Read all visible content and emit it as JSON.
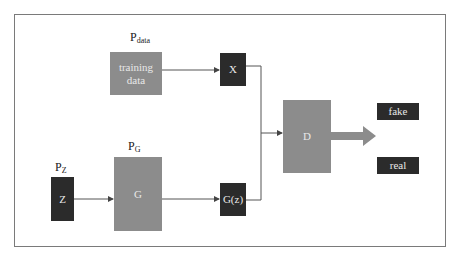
{
  "diagram": {
    "type": "GAN architecture",
    "labels": {
      "p_data": {
        "base": "P",
        "sub": "data"
      },
      "p_g": {
        "base": "P",
        "sub": "G"
      },
      "p_z": {
        "base": "P",
        "sub": "Z"
      }
    },
    "nodes": {
      "training_data": {
        "line1": "training",
        "line2": "data"
      },
      "x": "X",
      "z": "Z",
      "g": "G",
      "gz": "G(z)",
      "d": "D",
      "fake": "fake",
      "real": "real"
    },
    "edges": [
      {
        "from": "training_data",
        "to": "x"
      },
      {
        "from": "z",
        "to": "g"
      },
      {
        "from": "g",
        "to": "gz"
      },
      {
        "from": "x",
        "to": "d"
      },
      {
        "from": "gz",
        "to": "d"
      },
      {
        "from": "d",
        "to": "output",
        "style": "thick"
      }
    ],
    "colors": {
      "gray_box": "#8c8c8c",
      "dark_box": "#2b2b2b",
      "line": "#555555",
      "thick_arrow": "#8c8c8c",
      "frame": "#7a7a7a"
    }
  }
}
